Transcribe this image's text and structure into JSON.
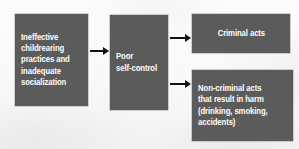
{
  "diagram": {
    "background_color": "#fbfbfa",
    "node_fill_color": "#5b5b5b",
    "node_text_color": "#ffffff",
    "arrow_color": "#121212",
    "nodes": [
      {
        "id": "parenting",
        "name": "ineffective-childrearing",
        "text": "Ineffective\nchildrearing\npractices and\ninadequate\nsocialization",
        "align": "left"
      },
      {
        "id": "selfcontrol",
        "name": "poor-self-control",
        "text": "Poor\nself-control",
        "align": "left"
      },
      {
        "id": "criminal",
        "name": "criminal-acts",
        "text": "Criminal acts",
        "align": "center"
      },
      {
        "id": "noncriminal",
        "name": "non-criminal-acts",
        "text": "Non-criminal acts\nthat result in harm\n(drinking, smoking,\naccidents)",
        "align": "left"
      }
    ],
    "arrows": [
      {
        "id": "a1",
        "from": "parenting",
        "to": "selfcontrol",
        "label": ""
      },
      {
        "id": "a2",
        "from": "selfcontrol",
        "to": "criminal",
        "label": ""
      },
      {
        "id": "a3",
        "from": "selfcontrol",
        "to": "noncriminal",
        "label": ""
      }
    ]
  }
}
